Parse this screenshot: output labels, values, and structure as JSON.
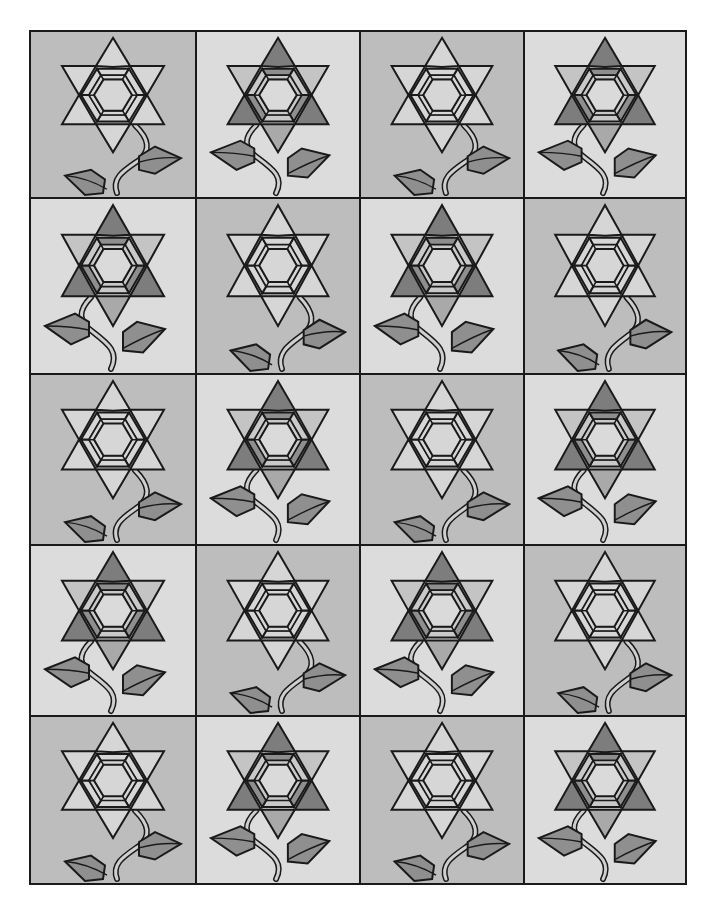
{
  "grid": {
    "rows": 5,
    "cols": 4
  },
  "colors": {
    "outline": "#1a1a1a",
    "bg_dark": "#bdbdbd",
    "bg_light": "#dcdcdc",
    "petal_pale": "#d6d6d6",
    "petal_pale_on_light": "#cfcfcf",
    "petal_dark": "#7d7d7d",
    "petal_mid": "#a9a9a9",
    "petal_light": "#c4c4c4",
    "ring_dark": "#8e8e8e",
    "ring_light": "#c9c9c9",
    "center": "#dadada",
    "leaf": "#8f8f8f",
    "stem": "#cfcfcf"
  },
  "variants": {
    "A": {
      "name": "light-flower-dark-background",
      "stem_side": "right"
    },
    "B": {
      "name": "shaded-flower-light-background",
      "stem_side": "left"
    }
  },
  "blocks": [
    {
      "row": 1,
      "col": 1,
      "variant": "A"
    },
    {
      "row": 1,
      "col": 2,
      "variant": "B"
    },
    {
      "row": 1,
      "col": 3,
      "variant": "A"
    },
    {
      "row": 1,
      "col": 4,
      "variant": "B"
    },
    {
      "row": 2,
      "col": 1,
      "variant": "B"
    },
    {
      "row": 2,
      "col": 2,
      "variant": "A"
    },
    {
      "row": 2,
      "col": 3,
      "variant": "B"
    },
    {
      "row": 2,
      "col": 4,
      "variant": "A"
    },
    {
      "row": 3,
      "col": 1,
      "variant": "A"
    },
    {
      "row": 3,
      "col": 2,
      "variant": "B"
    },
    {
      "row": 3,
      "col": 3,
      "variant": "A"
    },
    {
      "row": 3,
      "col": 4,
      "variant": "B"
    },
    {
      "row": 4,
      "col": 1,
      "variant": "B"
    },
    {
      "row": 4,
      "col": 2,
      "variant": "A"
    },
    {
      "row": 4,
      "col": 3,
      "variant": "B"
    },
    {
      "row": 4,
      "col": 4,
      "variant": "A"
    },
    {
      "row": 5,
      "col": 1,
      "variant": "A"
    },
    {
      "row": 5,
      "col": 2,
      "variant": "B"
    },
    {
      "row": 5,
      "col": 3,
      "variant": "A"
    },
    {
      "row": 5,
      "col": 4,
      "variant": "B"
    }
  ]
}
